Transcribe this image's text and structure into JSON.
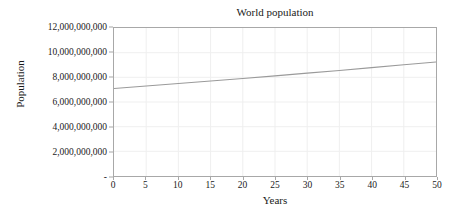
{
  "chart_data": {
    "type": "line",
    "title": "World population",
    "xlabel": "Years",
    "ylabel": "Population",
    "xlim": [
      0,
      50
    ],
    "ylim": [
      0,
      12000000000
    ],
    "grid": true,
    "legend": false,
    "legend_position": "none",
    "line_color": "#9a9a9a",
    "axis_color": "#a8a8a8",
    "grid_color": "#efefef",
    "background_color": "#ffffff",
    "text_color": "#1a1a1a",
    "x_tick_labels": [
      "0",
      "5",
      "10",
      "15",
      "20",
      "25",
      "30",
      "35",
      "40",
      "45",
      "50"
    ],
    "x_tick_values": [
      0,
      5,
      10,
      15,
      20,
      25,
      30,
      35,
      40,
      45,
      50
    ],
    "y_tick_labels": [
      "-",
      "2,000,000,000",
      "4,000,000,000",
      "6,000,000,000",
      "8,000,000,000",
      "10,000,000,000",
      "12,000,000,000"
    ],
    "y_tick_values": [
      0,
      2000000000,
      4000000000,
      6000000000,
      8000000000,
      10000000000,
      12000000000
    ],
    "series": [
      {
        "name": "World population",
        "x": [
          0,
          5,
          10,
          15,
          20,
          25,
          30,
          35,
          40,
          45,
          50
        ],
        "values": [
          7100000000,
          7300000000,
          7500000000,
          7700000000,
          7900000000,
          8120000000,
          8340000000,
          8560000000,
          8790000000,
          9020000000,
          9250000000
        ]
      }
    ]
  }
}
